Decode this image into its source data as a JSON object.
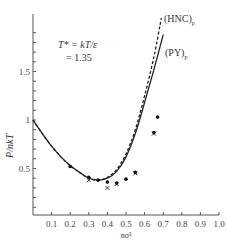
{
  "chart_data": {
    "type": "line",
    "title": "",
    "xlabel": "nσ³",
    "ylabel": "P/nkT",
    "xlim": [
      0,
      1.0
    ],
    "ylim": [
      0,
      2.2
    ],
    "grid": false,
    "x_ticks": [
      "0.1",
      "0.2",
      "0.3",
      "0.4",
      "0.5",
      "0.6",
      "0.7",
      "0.8",
      "0.9",
      "1.0"
    ],
    "y_ticks": [
      "0.5",
      "1",
      "1.5"
    ],
    "annotation": {
      "line1": "T* = kT/ε",
      "line2": "= 1.35"
    },
    "series": [
      {
        "name": "(PY)p",
        "label_main": "(PY)",
        "label_sub": "p",
        "style": "solid",
        "x": [
          0.0,
          0.05,
          0.1,
          0.15,
          0.2,
          0.25,
          0.3,
          0.35,
          0.4,
          0.45,
          0.5,
          0.55,
          0.6,
          0.65,
          0.7
        ],
        "y": [
          1.0,
          0.86,
          0.73,
          0.62,
          0.53,
          0.46,
          0.4,
          0.38,
          0.4,
          0.47,
          0.62,
          0.86,
          1.18,
          1.52,
          1.88
        ]
      },
      {
        "name": "(HNC)p",
        "label_main": "(HNC)",
        "label_sub": "p",
        "style": "dashed",
        "x": [
          0.0,
          0.05,
          0.1,
          0.15,
          0.2,
          0.25,
          0.3,
          0.35,
          0.4,
          0.45,
          0.5,
          0.55,
          0.6,
          0.65,
          0.69
        ],
        "y": [
          1.0,
          0.86,
          0.73,
          0.62,
          0.53,
          0.46,
          0.4,
          0.38,
          0.41,
          0.49,
          0.65,
          0.9,
          1.25,
          1.65,
          2.05
        ]
      },
      {
        "name": "simulation (dots)",
        "style": "marker-dot",
        "x": [
          0.2,
          0.3,
          0.35,
          0.4,
          0.45,
          0.5,
          0.55,
          0.65,
          0.67
        ],
        "y": [
          0.52,
          0.41,
          0.38,
          0.36,
          0.35,
          0.39,
          0.46,
          0.87,
          1.03
        ]
      },
      {
        "name": "simulation (crosses)",
        "style": "marker-cross",
        "x": [
          0.3,
          0.4,
          0.45,
          0.55,
          0.65
        ],
        "y": [
          0.38,
          0.3,
          0.34,
          0.45,
          0.86
        ]
      }
    ]
  }
}
